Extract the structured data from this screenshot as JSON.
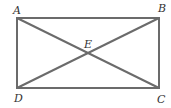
{
  "diagram": {
    "type": "rectangle-with-diagonals",
    "stroke_color": "#6b6b6b",
    "points": {
      "A": {
        "label": "A",
        "x": 17,
        "y": 18
      },
      "B": {
        "label": "B",
        "x": 159,
        "y": 18
      },
      "C": {
        "label": "C",
        "x": 159,
        "y": 88
      },
      "D": {
        "label": "D",
        "x": 17,
        "y": 88
      },
      "E": {
        "label": "E",
        "x": 88,
        "y": 53
      }
    },
    "segments": [
      "AB",
      "BC",
      "CD",
      "DA",
      "AC",
      "BD"
    ]
  }
}
